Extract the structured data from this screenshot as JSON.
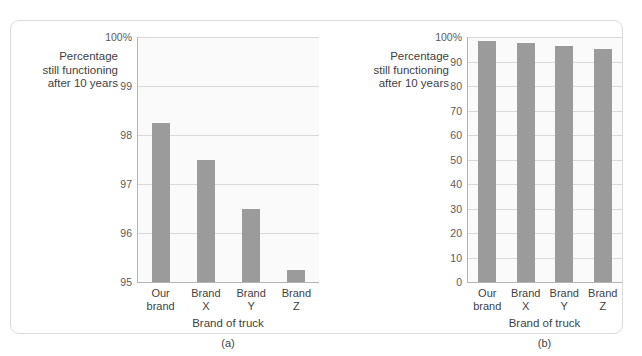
{
  "figure": {
    "background_color": "#ffffff",
    "card_border_color": "#dcdcdc",
    "bar_color": "#9b9b9b",
    "plot_background_color": "#fafafa",
    "gridline_color": "#d9d9d9",
    "axis_color": "#b4b4b4"
  },
  "chart_data": [
    {
      "type": "bar",
      "panel": "(a)",
      "title": "",
      "categories": [
        "Our brand",
        "Brand X",
        "Brand Y",
        "Brand Z"
      ],
      "category_lines": [
        [
          "Our",
          "brand"
        ],
        [
          "Brand",
          "X"
        ],
        [
          "Brand",
          "Y"
        ],
        [
          "Brand",
          "Z"
        ]
      ],
      "values": [
        98.25,
        97.5,
        96.5,
        95.25
      ],
      "xlabel": "Brand of truck",
      "ylabel": "Percentage still functioning after 10 years",
      "ylabel_lines": [
        "Percentage",
        "still functioning",
        "after 10 years"
      ],
      "ylim": [
        95,
        100
      ],
      "yticks": [
        95,
        96,
        97,
        98,
        99,
        100
      ],
      "ytick_labels": [
        "95",
        "96",
        "97",
        "98",
        "99",
        "100%"
      ],
      "grid": true,
      "legend": "none"
    },
    {
      "type": "bar",
      "panel": "(b)",
      "title": "",
      "categories": [
        "Our brand",
        "Brand X",
        "Brand Y",
        "Brand Z"
      ],
      "category_lines": [
        [
          "Our",
          "brand"
        ],
        [
          "Brand",
          "X"
        ],
        [
          "Brand",
          "Y"
        ],
        [
          "Brand",
          "Z"
        ]
      ],
      "values": [
        98.25,
        97.5,
        96.5,
        95.25
      ],
      "xlabel": "Brand of truck",
      "ylabel": "Percentage still functioning after 10 years",
      "ylabel_lines": [
        "Percentage",
        "still functioning",
        "after 10 years"
      ],
      "ylim": [
        0,
        100
      ],
      "yticks": [
        0,
        10,
        20,
        30,
        40,
        50,
        60,
        70,
        80,
        90,
        100
      ],
      "ytick_labels": [
        "0",
        "10",
        "20",
        "30",
        "40",
        "50",
        "60",
        "70",
        "80",
        "90",
        "100%"
      ],
      "grid": true,
      "legend": "none"
    }
  ]
}
